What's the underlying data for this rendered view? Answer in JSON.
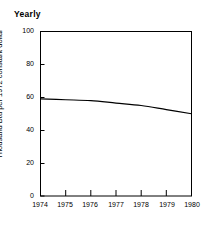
{
  "chart_data": {
    "type": "line",
    "title": "Yearly",
    "xlabel": "",
    "ylabel": "Thousand Btu per 1972 constant dollar",
    "x": [
      1974,
      1975,
      1976,
      1977,
      1978,
      1979,
      1980
    ],
    "values": [
      59,
      58.5,
      58,
      56.5,
      55,
      52.5,
      50
    ],
    "xtick_labels": [
      "1974",
      "1975",
      "1976",
      "1977",
      "1978",
      "1979",
      "1980"
    ],
    "ytick_labels": [
      "0",
      "20",
      "40",
      "60",
      "80",
      "100"
    ],
    "ytick_values": [
      0,
      20,
      40,
      60,
      80,
      100
    ],
    "ylim": [
      0,
      100
    ],
    "xlim": [
      1974,
      1980
    ],
    "grid": false,
    "legend": false,
    "line_color": "#000000"
  }
}
